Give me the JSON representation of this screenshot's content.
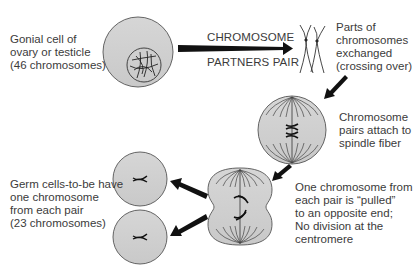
{
  "diagram": {
    "colors": {
      "cell_fill": "#cfcfcf",
      "cell_stroke": "#444444",
      "arrow": "#111111",
      "text": "#3b3b3b",
      "background": "#ffffff"
    },
    "nodes": [
      {
        "id": "gonial-cell",
        "shape": "circle with nucleus",
        "label_lines": [
          "Gonial cell of",
          "ovary or testicle",
          "(46 chromosomes)"
        ]
      },
      {
        "id": "crossing-over",
        "shape": "paired crossed chromosomes",
        "label_lines": [
          "Parts of",
          "chromosomes",
          "exchanged",
          "(crossing over)"
        ]
      },
      {
        "id": "spindle-cell",
        "shape": "circle with spindle fibers",
        "label_lines": [
          "Chromosome",
          "pairs attach to",
          "spindle fiber"
        ]
      },
      {
        "id": "dividing-cell",
        "shape": "pinched figure-eight cell",
        "label_lines": [
          "One chromosome from",
          "each pair is “pulled”",
          "to an opposite end;",
          "No division at the",
          "centromere"
        ]
      },
      {
        "id": "germ-cells",
        "shape": "two small circles",
        "label_lines": [
          "Germ cells-to-be have",
          "one chromosome",
          "from each pair",
          "(23 chromosomes)"
        ]
      }
    ],
    "edges": [
      {
        "from": "gonial-cell",
        "to": "crossing-over",
        "label_top": "CHROMOSOME",
        "label_bottom": "PARTNERS PAIR"
      },
      {
        "from": "crossing-over",
        "to": "spindle-cell"
      },
      {
        "from": "spindle-cell",
        "to": "dividing-cell"
      },
      {
        "from": "dividing-cell",
        "to": "germ-cells"
      },
      {
        "from": "dividing-cell",
        "to": "germ-cells"
      }
    ]
  }
}
